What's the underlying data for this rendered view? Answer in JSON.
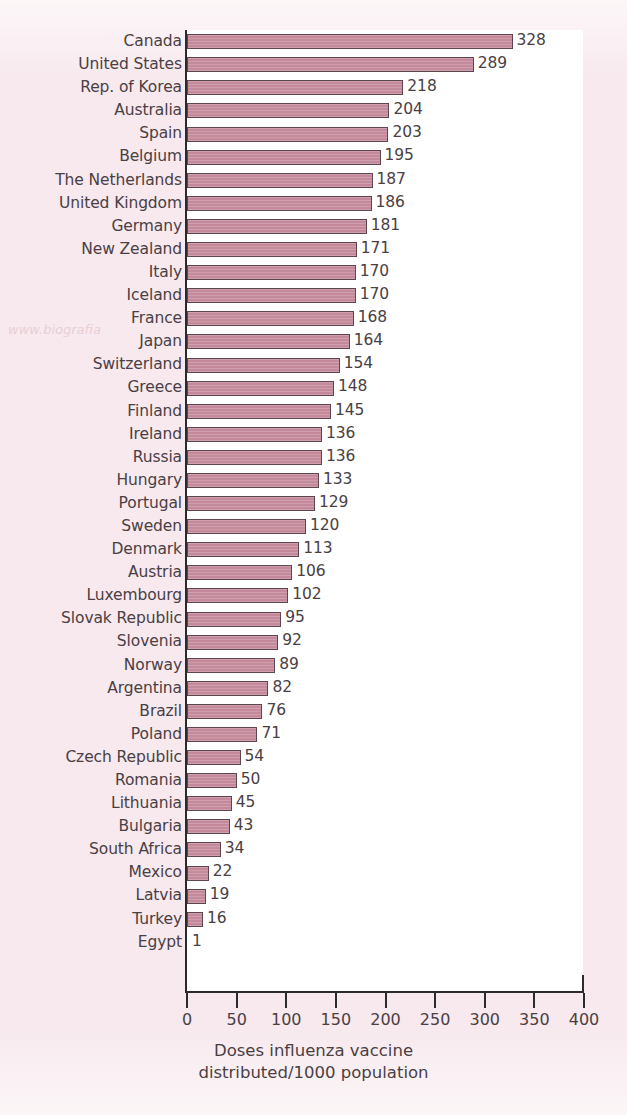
{
  "chart_data": {
    "type": "bar",
    "orientation": "horizontal",
    "title": "",
    "xlabel_line1": "Doses influenza vaccine",
    "xlabel_line2": "distributed/1000 population",
    "ylabel": "",
    "xlim": [
      0,
      400
    ],
    "xticks": [
      0,
      50,
      100,
      150,
      200,
      250,
      300,
      350,
      400
    ],
    "grid": false,
    "legend": null,
    "bar_color": "#c48a9b",
    "bar_edge_color": "#5d4650",
    "plot_background": "#ffffff",
    "page_background": "#f8ecf0",
    "text_color": "#4a4044",
    "categories": [
      "Canada",
      "United States",
      "Rep. of Korea",
      "Australia",
      "Spain",
      "Belgium",
      "The Netherlands",
      "United Kingdom",
      "Germany",
      "New Zealand",
      "Italy",
      "Iceland",
      "France",
      "Japan",
      "Switzerland",
      "Greece",
      "Finland",
      "Ireland",
      "Russia",
      "Hungary",
      "Portugal",
      "Sweden",
      "Denmark",
      "Austria",
      "Luxembourg",
      "Slovak Republic",
      "Slovenia",
      "Norway",
      "Argentina",
      "Brazil",
      "Poland",
      "Czech Republic",
      "Romania",
      "Lithuania",
      "Bulgaria",
      "South Africa",
      "Mexico",
      "Latvia",
      "Turkey",
      "Egypt"
    ],
    "values": [
      328,
      289,
      218,
      204,
      203,
      195,
      187,
      186,
      181,
      171,
      170,
      170,
      168,
      164,
      154,
      148,
      145,
      136,
      136,
      133,
      129,
      120,
      113,
      106,
      102,
      95,
      92,
      89,
      82,
      76,
      71,
      54,
      50,
      45,
      43,
      34,
      22,
      19,
      16,
      1
    ]
  },
  "scan_artifact_text": "www.biografia"
}
